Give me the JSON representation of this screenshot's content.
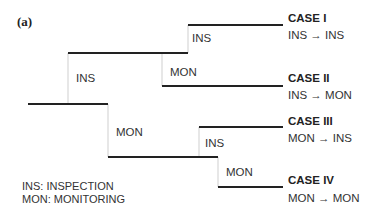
{
  "panel_label": "(a)",
  "branches": {
    "root_upper": "INS",
    "root_lower": "MON",
    "upper_upper": "INS",
    "upper_lower": "MON",
    "lower_upper": "INS",
    "lower_lower": "MON"
  },
  "cases": [
    {
      "title": "CASE I",
      "transition": "INS → INS"
    },
    {
      "title": "CASE II",
      "transition": "INS → MON"
    },
    {
      "title": "CASE III",
      "transition": "MON → INS"
    },
    {
      "title": "CASE IV",
      "transition": "MON → MON"
    }
  ],
  "legend": [
    "INS: INSPECTION",
    "MON: MONITORING"
  ],
  "colors": {
    "line": "#222222",
    "connector": "#cccccc"
  }
}
